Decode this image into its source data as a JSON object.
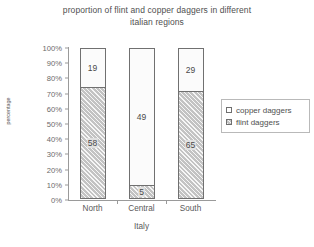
{
  "chart_data": {
    "type": "bar",
    "subtype": "stacked-percentage",
    "title": "proportion of flint  and copper daggers in different",
    "title_line2": "italian regions",
    "xlabel": "Italy",
    "ylabel": "percentage",
    "categories": [
      "North",
      "Central",
      "South"
    ],
    "ylim": [
      0,
      100
    ],
    "ytick_labels": [
      "0%",
      "10%",
      "20%",
      "30%",
      "40%",
      "50%",
      "60%",
      "70%",
      "80%",
      "90%",
      "100%"
    ],
    "grid": false,
    "legend_position": "right",
    "series": [
      {
        "name": "copper daggers",
        "values": [
          19,
          49,
          29
        ],
        "percent_of_bar": [
          26,
          91,
          29
        ],
        "color": "#fbfbfb",
        "pattern": "solid"
      },
      {
        "name": "flint daggers",
        "values": [
          58,
          5,
          65
        ],
        "percent_of_bar": [
          74,
          9,
          71
        ],
        "color": "#c3c3c3",
        "pattern": "hatched"
      }
    ]
  },
  "axis": {
    "yticks": [
      {
        "label": "100%",
        "pct": 100
      },
      {
        "label": "90%",
        "pct": 90
      },
      {
        "label": "80%",
        "pct": 80
      },
      {
        "label": "70%",
        "pct": 70
      },
      {
        "label": "60%",
        "pct": 60
      },
      {
        "label": "50%",
        "pct": 50
      },
      {
        "label": "40%",
        "pct": 40
      },
      {
        "label": "30%",
        "pct": 30
      },
      {
        "label": "20%",
        "pct": 20
      },
      {
        "label": "10%",
        "pct": 10
      },
      {
        "label": "0%",
        "pct": 0
      }
    ]
  },
  "legend": {
    "items": [
      {
        "label": "copper daggers",
        "swatch": "copper"
      },
      {
        "label": "flint daggers",
        "swatch": "flint"
      }
    ]
  }
}
